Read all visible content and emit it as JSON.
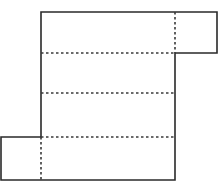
{
  "diagram": {
    "type": "cuboid-net",
    "canvas": {
      "width": 224,
      "height": 187,
      "background": "#ffffff"
    },
    "colors": {
      "stroke": "#2a2a2a",
      "fold": "#3a3a3a"
    },
    "main_rect": {
      "x": 41,
      "y": 12,
      "w": 134,
      "h": 168
    },
    "right_flap": {
      "x": 175,
      "y": 12,
      "w": 42,
      "h": 41
    },
    "left_flap": {
      "x": 1,
      "y": 137,
      "w": 40,
      "h": 43
    },
    "fold_lines_horizontal": [
      53,
      93,
      137
    ],
    "fold_lines_vertical": [
      {
        "x": 175,
        "y1": 12,
        "y2": 53
      },
      {
        "x": 41,
        "y1": 137,
        "y2": 180
      }
    ]
  }
}
